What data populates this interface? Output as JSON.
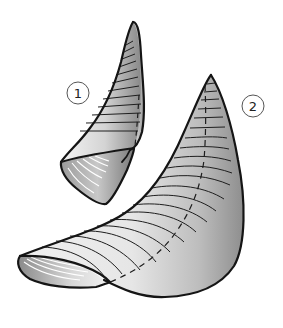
{
  "figure": {
    "background": "#ffffff",
    "stroke_color": "#1a1a1a",
    "shading_light": "#f2f2f2",
    "shading_dark": "#8c8c8c"
  },
  "shapes": [
    {
      "id": 1,
      "label": "1",
      "label_pos": {
        "x": 78,
        "y": 93
      }
    },
    {
      "id": 2,
      "label": "2",
      "label_pos": {
        "x": 253,
        "y": 106
      }
    }
  ]
}
